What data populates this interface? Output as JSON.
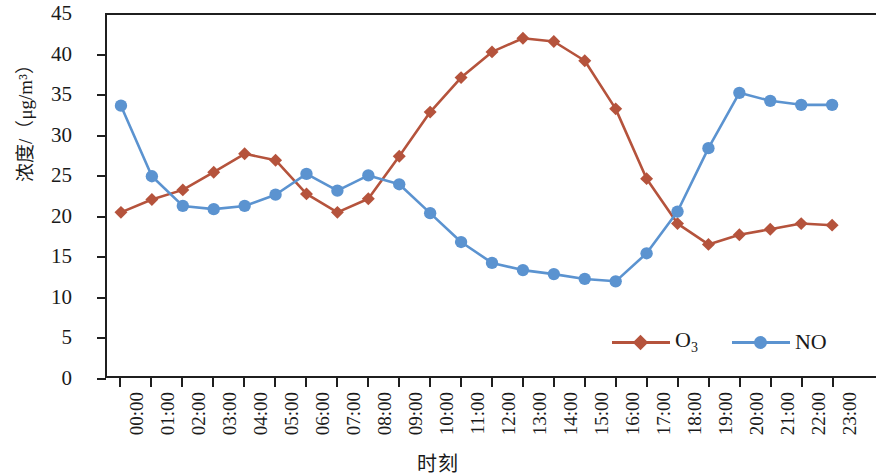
{
  "chart_data": {
    "type": "line",
    "title": "",
    "xlabel": "时刻",
    "ylabel": "浓度/（μg/m³）",
    "ylim": [
      0,
      45
    ],
    "ytick_values": [
      0,
      5,
      10,
      15,
      20,
      25,
      30,
      35,
      40,
      45
    ],
    "ytick_labels": [
      "0",
      "5",
      "10",
      "15",
      "20",
      "25",
      "30",
      "35",
      "40",
      "45"
    ],
    "grid": false,
    "legend_position": "inside-bottom-right",
    "categories": [
      "00:00",
      "01:00",
      "02:00",
      "03:00",
      "04:00",
      "05:00",
      "06:00",
      "07:00",
      "08:00",
      "09:00",
      "10:00",
      "11:00",
      "12:00",
      "13:00",
      "14:00",
      "15:00",
      "16:00",
      "17:00",
      "18:00",
      "19:00",
      "20:00",
      "21:00",
      "22:00",
      "23:00"
    ],
    "series": [
      {
        "name": "O3",
        "label": "O",
        "label_sub": "3",
        "color": "#b5533c",
        "marker": "diamond",
        "values": [
          20.4,
          22.0,
          23.2,
          25.4,
          27.7,
          26.9,
          22.7,
          20.4,
          22.1,
          27.4,
          32.9,
          37.2,
          40.4,
          42.1,
          41.7,
          39.3,
          33.3,
          24.6,
          19.0,
          16.4,
          17.6,
          18.3,
          19.0,
          18.8
        ]
      },
      {
        "name": "NO",
        "label": "NO",
        "label_sub": "",
        "color": "#5b93d0",
        "marker": "circle",
        "values": [
          33.7,
          24.9,
          21.2,
          20.8,
          21.2,
          22.6,
          25.2,
          23.1,
          25.0,
          23.9,
          20.3,
          16.7,
          14.1,
          13.2,
          12.7,
          12.1,
          11.8,
          15.3,
          20.5,
          28.4,
          35.3,
          34.3,
          33.8,
          33.8
        ]
      }
    ]
  },
  "axes": {
    "y_title": "浓度/（μg/m³）",
    "x_title": "时刻"
  },
  "legend": {
    "items": [
      {
        "label": "O",
        "sub": "3",
        "color": "#b5533c",
        "marker": "diamond"
      },
      {
        "label": "NO",
        "sub": "",
        "color": "#5b93d0",
        "marker": "circle"
      }
    ]
  },
  "colors": {
    "o3": "#b5533c",
    "no": "#5b93d0",
    "axis": "#1f1f1f",
    "background": "#ffffff"
  }
}
